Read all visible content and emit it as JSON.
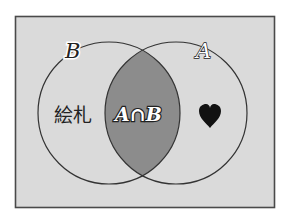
{
  "diagram": {
    "type": "venn",
    "sets": [
      {
        "id": "B",
        "label": "B",
        "region_label": "絵札"
      },
      {
        "id": "A",
        "label": "A",
        "region_label": "♥"
      }
    ],
    "intersection": {
      "label": "A∩B",
      "highlighted": true
    },
    "colors": {
      "background": "#dadada",
      "intersection_fill": "#8c8c8c",
      "stroke": "#333333"
    }
  }
}
